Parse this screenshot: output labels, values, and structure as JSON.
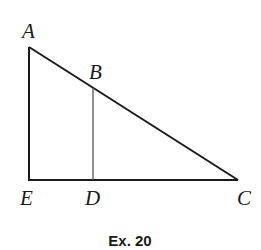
{
  "figure": {
    "caption": "Ex. 20",
    "points": {
      "A": {
        "label": "A",
        "x": 29,
        "y": 47
      },
      "B": {
        "label": "B",
        "x": 93,
        "y": 88
      },
      "C": {
        "label": "C",
        "x": 238,
        "y": 180
      },
      "D": {
        "label": "D",
        "x": 93,
        "y": 180
      },
      "E": {
        "label": "E",
        "x": 29,
        "y": 180
      }
    },
    "segments": [
      [
        "A",
        "E"
      ],
      [
        "E",
        "C"
      ],
      [
        "A",
        "C"
      ],
      [
        "B",
        "D"
      ]
    ],
    "colors": {
      "line": "#1a1a1a",
      "thin_line": "#555555",
      "background": "#ffffff"
    }
  }
}
